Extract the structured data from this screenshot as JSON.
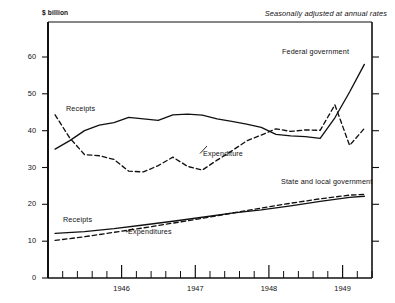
{
  "chart_data": {
    "type": "line",
    "title": "",
    "subtitle": "Seasonally adjusted at annual rates",
    "ylabel": "$ billion",
    "xlabel": "",
    "ylim": [
      0,
      65
    ],
    "xlim": [
      1945.5,
      1951.0
    ],
    "grid": false,
    "legend": "inline-annotations",
    "ytick_labels": [
      "0",
      "10",
      "20",
      "30",
      "40",
      "50",
      "60"
    ],
    "ytick_values": [
      0,
      10,
      20,
      30,
      40,
      50,
      60
    ],
    "xtick_labels": [
      "1946",
      "1947",
      "1948",
      "1949",
      "1950"
    ],
    "xtick_values": [
      1946,
      1947,
      1948,
      1949,
      1950
    ],
    "minor_xticks_per_year": 4,
    "group_labels": {
      "federal": "Federal government",
      "state_local": "State and local government"
    },
    "series": [
      {
        "name": "Receipts",
        "group": "Federal government",
        "style": "solid",
        "annotation": "Receipts",
        "x": [
          1945.62,
          1945.87,
          1946.12,
          1946.37,
          1946.62,
          1946.87,
          1947.12,
          1947.37,
          1947.62,
          1947.87,
          1948.12,
          1948.37,
          1948.62,
          1948.87,
          1949.12,
          1949.37,
          1949.62,
          1949.87,
          1950.12,
          1950.37,
          1950.62,
          1950.87
        ],
        "values": [
          35.0,
          37.3,
          40.0,
          41.5,
          42.2,
          43.6,
          43.2,
          42.8,
          44.3,
          44.5,
          44.2,
          43.2,
          42.5,
          41.8,
          40.9,
          39.0,
          38.6,
          38.4,
          37.9,
          43.5,
          50.5,
          58.0
        ]
      },
      {
        "name": "Expenditure",
        "group": "Federal government",
        "style": "dashed",
        "annotation": "Expenditure",
        "x": [
          1945.62,
          1945.87,
          1946.12,
          1946.37,
          1946.62,
          1946.87,
          1947.12,
          1947.37,
          1947.62,
          1947.87,
          1948.12,
          1948.37,
          1948.62,
          1948.87,
          1949.12,
          1949.37,
          1949.62,
          1949.87,
          1950.12,
          1950.37,
          1950.62,
          1950.87
        ],
        "values": [
          44.3,
          38.0,
          33.5,
          33.2,
          32.2,
          29.0,
          28.8,
          30.5,
          32.8,
          30.3,
          29.3,
          32.0,
          34.5,
          37.2,
          38.8,
          40.5,
          39.8,
          40.2,
          40.1,
          47.0,
          36.0,
          40.6
        ]
      },
      {
        "name": "Receipts",
        "group": "State and local government",
        "style": "solid",
        "annotation": "Receipts",
        "x": [
          1945.62,
          1946.12,
          1946.62,
          1947.12,
          1947.62,
          1948.12,
          1948.62,
          1949.12,
          1949.62,
          1950.12,
          1950.62,
          1950.87
        ],
        "values": [
          12.1,
          12.6,
          13.4,
          14.4,
          15.4,
          16.5,
          17.6,
          18.5,
          19.6,
          20.8,
          21.9,
          22.2
        ]
      },
      {
        "name": "Expenditures",
        "group": "State and local government",
        "style": "dashed",
        "annotation": "Expenditures",
        "x": [
          1945.62,
          1946.12,
          1946.62,
          1947.12,
          1947.62,
          1948.12,
          1948.62,
          1949.12,
          1949.62,
          1950.12,
          1950.62,
          1950.87
        ],
        "values": [
          10.2,
          11.2,
          12.4,
          13.6,
          14.9,
          16.2,
          17.6,
          19.0,
          20.3,
          21.5,
          22.5,
          22.7
        ]
      }
    ]
  },
  "axis": {
    "unit_label": "$ billion",
    "note": "Seasonally adjusted at annual rates",
    "y": {
      "t0": "0",
      "t10": "10",
      "t20": "20",
      "t30": "30",
      "t40": "40",
      "t50": "50",
      "t60": "60"
    },
    "x": {
      "t1946": "1946",
      "t1947": "1947",
      "t1948": "1948",
      "t1949": "1949",
      "t1950": "1950"
    }
  },
  "annotations": {
    "federal_group": "Federal government",
    "state_group": "State and local government",
    "federal_receipts": "Receipts",
    "federal_expenditure": "Expenditure",
    "state_receipts": "Receipts",
    "state_expenditures": "Expenditures"
  },
  "colors": {
    "ink": "#111111",
    "background": "#ffffff"
  }
}
